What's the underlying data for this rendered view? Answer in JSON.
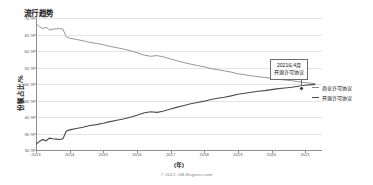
{
  "chart": {
    "title": "流行趋势",
    "footer": "© 2021, DB-Engines.com"
  },
  "annotation": {
    "line1": "2021年4月",
    "line2": "开源许可协议"
  },
  "legend": {
    "items": [
      {
        "label": "商业许可协议",
        "color": "#8a8a8a"
      },
      {
        "label": "开源许可协议",
        "color": "#4a4a4a"
      }
    ]
  },
  "chart_data": {
    "type": "line",
    "title": "流行趋势",
    "xlabel": "(年)",
    "ylabel": "份额占比/%",
    "xlim": [
      2013,
      2021.5
    ],
    "ylim": [
      30,
      70
    ],
    "grid": true,
    "legend_position": "right",
    "ytick_labels": [
      "70 %",
      "65 %",
      "60 %",
      "55 %",
      "50 %",
      "45 %",
      "40 %",
      "35 %",
      "30 %"
    ],
    "ytick_values": [
      70,
      65,
      60,
      55,
      50,
      45,
      40,
      35,
      30
    ],
    "xtick_labels": [
      "2013",
      "2014",
      "2015",
      "2016",
      "2017",
      "2018",
      "2019",
      "2020",
      "2021"
    ],
    "xtick_values": [
      2013,
      2014,
      2015,
      2016,
      2017,
      2018,
      2019,
      2020,
      2021
    ],
    "x": [
      2013.0,
      2013.1,
      2013.2,
      2013.3,
      2013.4,
      2013.5,
      2013.6,
      2013.7,
      2013.8,
      2013.9,
      2014.0,
      2014.2,
      2014.4,
      2014.6,
      2014.8,
      2015.0,
      2015.2,
      2015.4,
      2015.6,
      2015.8,
      2016.0,
      2016.2,
      2016.4,
      2016.6,
      2016.8,
      2017.0,
      2017.2,
      2017.4,
      2017.6,
      2017.8,
      2018.0,
      2018.2,
      2018.4,
      2018.6,
      2018.8,
      2019.0,
      2019.2,
      2019.4,
      2019.6,
      2019.8,
      2020.0,
      2020.2,
      2020.4,
      2020.6,
      2020.8,
      2021.0,
      2021.2,
      2021.3
    ],
    "series": [
      {
        "name": "商业许可协议",
        "color": "#8a8a8a",
        "values": [
          68.3,
          67.4,
          66.8,
          67.2,
          66.4,
          66.6,
          66.7,
          66.8,
          66.6,
          64.3,
          63.9,
          63.5,
          63.1,
          62.6,
          62.3,
          61.9,
          61.4,
          61.0,
          60.6,
          60.1,
          59.5,
          58.8,
          58.4,
          58.6,
          58.2,
          57.6,
          57.0,
          56.5,
          56.0,
          55.6,
          55.2,
          54.7,
          54.3,
          54.0,
          53.6,
          53.1,
          52.8,
          52.5,
          52.2,
          52.0,
          51.7,
          51.4,
          51.2,
          51.0,
          50.7,
          50.4,
          50.2,
          50.1
        ]
      },
      {
        "name": "开源许可协议",
        "color": "#4a4a4a",
        "values": [
          31.7,
          32.6,
          33.2,
          32.8,
          33.6,
          33.4,
          33.3,
          33.2,
          33.4,
          35.7,
          36.1,
          36.5,
          36.9,
          37.4,
          37.7,
          38.1,
          38.6,
          39.0,
          39.4,
          39.9,
          40.5,
          41.2,
          41.6,
          41.4,
          41.8,
          42.4,
          43.0,
          43.5,
          44.0,
          44.4,
          44.8,
          45.3,
          45.7,
          46.0,
          46.4,
          46.9,
          47.2,
          47.5,
          47.8,
          48.0,
          48.3,
          48.6,
          48.8,
          49.0,
          49.3,
          49.6,
          49.8,
          49.9
        ]
      }
    ],
    "annotations": [
      {
        "text": "2021年4月 开源许可协议",
        "x": 2021.3,
        "y": 49.9
      }
    ]
  }
}
